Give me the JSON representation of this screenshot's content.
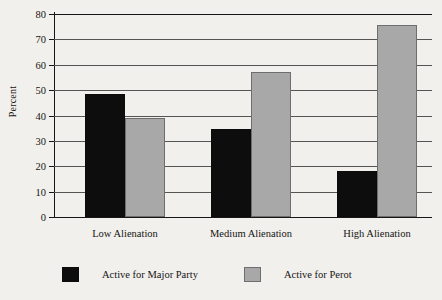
{
  "chart_data": {
    "type": "bar",
    "title": "",
    "subtitle": "",
    "xlabel": "",
    "ylabel": "Percent",
    "ylim": [
      0,
      80
    ],
    "ytick_labels": [
      "0",
      "10",
      "20",
      "30",
      "40",
      "50",
      "60",
      "70",
      "80"
    ],
    "yticks": [
      0,
      10,
      20,
      30,
      40,
      50,
      60,
      70,
      80
    ],
    "grid": true,
    "legend_position": "bottom",
    "categories": [
      "Low Alienation",
      "Medium Alienation",
      "High Alienation"
    ],
    "series": [
      {
        "name": "Active for Major Party",
        "color": "#0d0d0d",
        "values": [
          48.5,
          34.5,
          18
        ]
      },
      {
        "name": "Active for Perot",
        "color": "#a8a8a8",
        "values": [
          39,
          57,
          75.5
        ]
      }
    ]
  },
  "colors": {
    "background": "#f2f0ec",
    "axis": "#161616",
    "gridline": "#555555",
    "major_party": "#0d0d0d",
    "perot": "#a8a8a8"
  }
}
